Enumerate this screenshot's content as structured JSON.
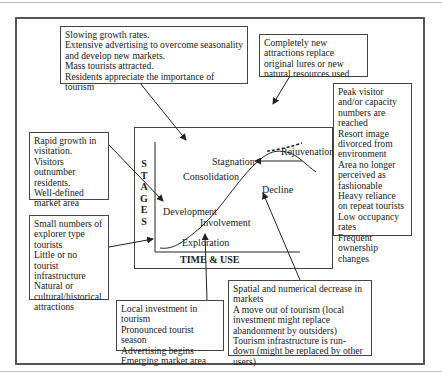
{
  "diagram": {
    "axes": {
      "y_label_letters": [
        "S",
        "T",
        "A",
        "G",
        "E",
        "S"
      ],
      "y_label": "STAGES",
      "x_label": "TIME & USE"
    },
    "stages": {
      "exploration": "Exploration",
      "involvement": "Involvement",
      "development": "Development",
      "consolidation": "Consolidation",
      "stagnation": "Stagnation",
      "rejuvenation": "Rejuvenation",
      "decline": "Decline"
    },
    "annotations": {
      "consolidation_box": "Slowing growth rates.\nExtensive advertising to overcome seasonality and develop new markets.\nMass tourists attracted.\nResidents appreciate the importance of tourism",
      "rejuvenation_box": "Completely new attractions replace original lures or new natural resources used",
      "stagnation_box": "Peak visitor and/or capacity numbers are reached\nResort image divorced from environment\nArea no longer perceived as fashionable\nHeavy reliance on repeat tourists\nLow occupancy rates\nFrequent ownership changes",
      "development_box": "Rapid growth in visitation.\nVisitors outnumber residents.\nWell-defined market area",
      "exploration_box": "Small numbers of explorer type tourists\nLittle or no tourist infrastructure\nNatural or cultural/historical attractions",
      "involvement_box": "Local investment in tourism\nPronounced tourist season\nAdvertising begins\nEmerging market area",
      "decline_box": "Spatial and numerical decrease in markets\nA move out of tourism (local investment might replace abandonment by outsiders)\nTourism infrastructure is run-down (might be replaced by other users)"
    },
    "colors": {
      "line": "#222222",
      "frame": "#555555",
      "background": "#ffffff"
    }
  }
}
